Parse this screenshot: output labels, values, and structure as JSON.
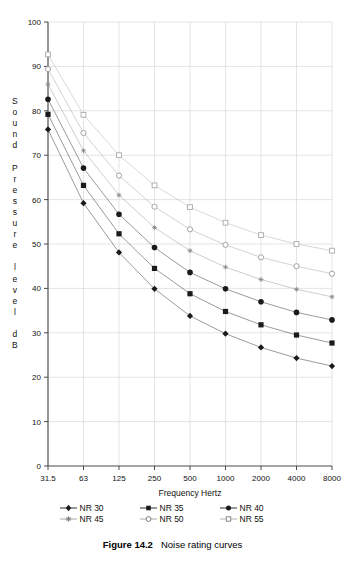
{
  "figure": {
    "caption_label": "Figure 14.2",
    "caption_text": "Noise rating curves"
  },
  "y_axis_title_chars": "S\no\nu\nn\nd\n\nP\nr\ne\ns\ns\nu\nr\ne\n\nl\ne\nv\ne\nl\n\nd\nB",
  "legend": {
    "rows": [
      [
        {
          "label": "NR 30",
          "marker": "filled-diamond",
          "color": "#1a1a1a"
        },
        {
          "label": "NR 35",
          "marker": "filled-square",
          "color": "#1a1a1a"
        },
        {
          "label": "NR 40",
          "marker": "filled-circle",
          "color": "#1a1a1a"
        }
      ],
      [
        {
          "label": "NR 45",
          "marker": "star",
          "color": "#8d8d8d"
        },
        {
          "label": "NR 50",
          "marker": "open-circle",
          "color": "#9a9a9a"
        },
        {
          "label": "NR 55",
          "marker": "open-square",
          "color": "#a8a8a8"
        }
      ]
    ]
  },
  "chart_data": {
    "type": "line",
    "title": "",
    "xlabel": "Frequency Hertz",
    "ylabel": "Sound Pressure level dB",
    "x": [
      31.5,
      63,
      125,
      250,
      500,
      1000,
      2000,
      4000,
      8000
    ],
    "categories": [
      "31.5",
      "63",
      "125",
      "250",
      "500",
      "1000",
      "2000",
      "4000",
      "8000"
    ],
    "xscale": "octave-band",
    "ylim": [
      0,
      100
    ],
    "yticks": [
      0,
      10,
      20,
      30,
      40,
      50,
      60,
      70,
      80,
      90,
      100
    ],
    "grid": true,
    "legend_position": "below",
    "series": [
      {
        "name": "NR 30",
        "marker": "filled-diamond",
        "color": "#1a1a1a",
        "values": [
          75.8,
          59.2,
          48.1,
          39.9,
          33.8,
          29.8,
          26.7,
          24.3,
          22.5
        ]
      },
      {
        "name": "NR 35",
        "marker": "filled-square",
        "color": "#1a1a1a",
        "values": [
          79.2,
          63.2,
          52.3,
          44.5,
          38.8,
          34.8,
          31.8,
          29.5,
          27.7
        ]
      },
      {
        "name": "NR 40",
        "marker": "filled-circle",
        "color": "#1a1a1a",
        "values": [
          82.6,
          67.1,
          56.7,
          49.2,
          43.6,
          39.9,
          37.0,
          34.6,
          32.9
        ]
      },
      {
        "name": "NR 45",
        "marker": "star",
        "color": "#8d8d8d",
        "values": [
          86.0,
          71.0,
          61.0,
          53.7,
          48.5,
          44.8,
          42.0,
          39.8,
          38.1
        ]
      },
      {
        "name": "NR 50",
        "marker": "open-circle",
        "color": "#9a9a9a",
        "values": [
          89.4,
          75.0,
          65.4,
          58.4,
          53.3,
          49.8,
          47.0,
          45.0,
          43.3
        ]
      },
      {
        "name": "NR 55",
        "marker": "open-square",
        "color": "#a8a8a8",
        "values": [
          92.7,
          79.1,
          70.0,
          63.2,
          58.3,
          54.8,
          52.0,
          50.0,
          48.5
        ]
      }
    ]
  }
}
